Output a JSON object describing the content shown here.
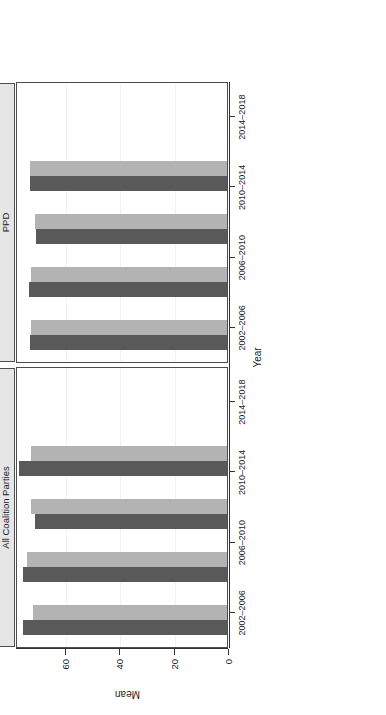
{
  "chart_data": {
    "type": "bar",
    "title": "",
    "orientation": "horizontal-rotated",
    "xlabel": "Year",
    "ylabel": "Mean",
    "ylim": [
      0,
      78
    ],
    "yticks": [
      0,
      20,
      40,
      60
    ],
    "ytick_labels": [
      "0",
      "20",
      "40",
      "60"
    ],
    "grid": true,
    "legend_position": "top-right",
    "panels": [
      {
        "name": "All Coalition Parties",
        "categories": [
          "2002–2006",
          "2006–2010",
          "2010–2014",
          "2014–2018"
        ],
        "series": [
          {
            "name": "Loyalty toward Coalition",
            "values": [
              75.0,
              75.2,
              70.6,
              76.6
            ]
          },
          {
            "name": "Loyalty toward Party (PPD)",
            "values": [
              71.2,
              73.6,
              72.0,
              72.1
            ]
          }
        ]
      },
      {
        "name": "PPD",
        "categories": [
          "2002–2006",
          "2006–2010",
          "2010–2014",
          "2014–2018"
        ],
        "series": [
          {
            "name": "Loyalty toward Coalition",
            "values": [
              72.6,
              72.7,
              70.4,
              72.4
            ]
          },
          {
            "name": "Loyalty toward Party (PPD)",
            "values": [
              72.2,
              72.2,
              70.6,
              72.5
            ]
          }
        ]
      }
    ],
    "series_colors": [
      "#595959",
      "#b3b3b3"
    ]
  },
  "legend": {
    "items": [
      {
        "label": "Loyalty toward Coalition",
        "color": "#595959"
      },
      {
        "label": "Loyalty toward Party (PPD)",
        "color": "#b3b3b3"
      }
    ]
  },
  "axes": {
    "x_title": "Year",
    "y_title": "Mean",
    "y_tick_labels": [
      "0",
      "20",
      "40",
      "60"
    ],
    "x_tick_labels": [
      "2002–2006",
      "2006–2010",
      "2010–2014",
      "2014–2018"
    ]
  },
  "panels": {
    "left_label": "All Coalition Parties",
    "right_label": "PPD"
  },
  "caption": {
    "mark": ""
  }
}
